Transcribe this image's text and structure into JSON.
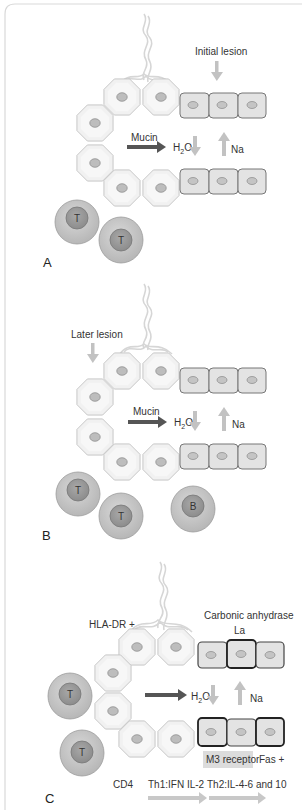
{
  "figure": {
    "colors": {
      "frame": "#d9d9d9",
      "acinar_fill": "#f0f0f0",
      "acinar_stroke": "#c8c8c8",
      "duct_fill": "#e2e2e2",
      "duct_stroke": "#7a7a7a",
      "duct_stroke_bold": "#3a3a3a",
      "nucleus_fill": "#bdbdbd",
      "nucleus_stroke": "#8a8a8a",
      "lymph_outer": "#c6c6c6",
      "lymph_inner": "#9a9a9a",
      "arrow_dark": "#555555",
      "arrow_light": "#c2c2c2",
      "m3_bg": "#dcdcdc"
    },
    "panels": [
      {
        "id": "A",
        "label": "A",
        "lesion_label": "Initial lesion",
        "mucin_label": "Mucin",
        "h2o_label": "H",
        "h2o_sub": "2",
        "h2o_suffix": "O",
        "na_label": "Na",
        "lymphocytes": [
          {
            "type": "T",
            "label": "T"
          },
          {
            "type": "T",
            "label": "T"
          }
        ]
      },
      {
        "id": "B",
        "label": "B",
        "lesion_label": "Later lesion",
        "mucin_label": "Mucin",
        "h2o_label": "H",
        "h2o_sub": "2",
        "h2o_suffix": "O",
        "na_label": "Na",
        "lymphocytes": [
          {
            "type": "T",
            "label": "T"
          },
          {
            "type": "T",
            "label": "T"
          },
          {
            "type": "B",
            "label": "B"
          }
        ]
      },
      {
        "id": "C",
        "label": "C",
        "hla_label": "HLA-DR +",
        "carbonic_label": "Carbonic anhydrase",
        "la_label": "La",
        "h2o_label": "H",
        "h2o_sub": "2",
        "h2o_suffix": "O",
        "na_label": "Na",
        "m3_label": "M3 receptor",
        "fas_label": "Fas +",
        "cd4_label": "CD4",
        "th1_label": "Th1:IFN IL-2",
        "th2_label": "Th2:IL-4-6 and 10",
        "lymphocytes": [
          {
            "type": "T",
            "label": "T"
          },
          {
            "type": "T",
            "label": "T"
          }
        ]
      }
    ]
  }
}
